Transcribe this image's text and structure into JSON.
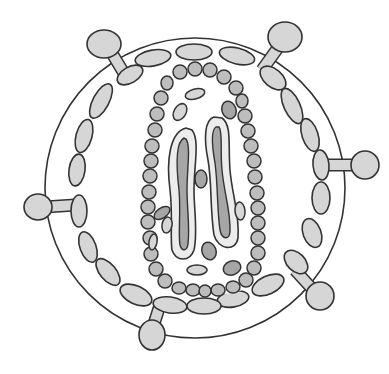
{
  "diagram": {
    "colors": {
      "background": "#ffffff",
      "stroke": "#333333",
      "light_fill": "#d6d6d6",
      "medium_fill": "#bdbdbd",
      "dark_fill": "#a6a6a6",
      "pale_fill": "#ececec"
    },
    "envelope": {
      "cx": 195,
      "cy": 188,
      "r": 150
    },
    "spikes": [
      {
        "name": "spike-top-left",
        "stem": [
          125,
          75,
          110,
          50
        ],
        "knob": [
          104,
          44,
          17,
          14
        ]
      },
      {
        "name": "spike-top-right",
        "stem": [
          262,
          70,
          280,
          45
        ],
        "knob": [
          285,
          37,
          17,
          15
        ]
      },
      {
        "name": "spike-right",
        "stem": [
          328,
          165,
          355,
          165
        ],
        "knob": [
          365,
          165,
          14,
          14
        ]
      },
      {
        "name": "spike-left",
        "stem": [
          75,
          205,
          45,
          207
        ],
        "knob": [
          38,
          207,
          14,
          13
        ]
      },
      {
        "name": "spike-bottom-left",
        "stem": [
          160,
          305,
          152,
          330
        ],
        "knob": [
          152,
          335,
          13,
          15
        ]
      },
      {
        "name": "spike-bottom-right",
        "stem": [
          295,
          270,
          315,
          292
        ],
        "knob": [
          320,
          296,
          14,
          14
        ]
      }
    ],
    "matrix_ellipses": [
      [
        153,
        58,
        18,
        8,
        -10
      ],
      [
        194,
        52,
        18,
        8,
        0
      ],
      [
        237,
        56,
        18,
        8,
        14
      ],
      [
        130,
        75,
        14,
        8,
        -30
      ],
      [
        273,
        78,
        15,
        9,
        40
      ],
      [
        101,
        101,
        19,
        8,
        -62
      ],
      [
        292,
        106,
        19,
        8,
        65
      ],
      [
        84,
        136,
        17,
        8,
        -75
      ],
      [
        310,
        135,
        17,
        8,
        72
      ],
      [
        77,
        170,
        16,
        8,
        -82
      ],
      [
        321,
        165,
        15,
        8,
        85
      ],
      [
        79,
        211,
        16,
        8,
        90
      ],
      [
        321,
        198,
        16,
        9,
        90
      ],
      [
        88,
        247,
        16,
        8,
        70
      ],
      [
        312,
        233,
        15,
        9,
        70
      ],
      [
        108,
        272,
        16,
        8,
        50
      ],
      [
        296,
        262,
        14,
        9,
        45
      ],
      [
        136,
        295,
        17,
        9,
        25
      ],
      [
        268,
        285,
        17,
        9,
        -25
      ],
      [
        170,
        305,
        17,
        8,
        8
      ],
      [
        233,
        299,
        16,
        8,
        -10
      ],
      [
        204,
        306,
        17,
        8,
        0
      ]
    ],
    "capsid_beads": [
      [
        180,
        72,
        7,
        7
      ],
      [
        195,
        69,
        7,
        7
      ],
      [
        210,
        70,
        7,
        7
      ],
      [
        224,
        77,
        7,
        7
      ],
      [
        167,
        83,
        6,
        7
      ],
      [
        236,
        88,
        7,
        7
      ],
      [
        161,
        98,
        7,
        7
      ],
      [
        242,
        101,
        6,
        7
      ],
      [
        157,
        114,
        7,
        7
      ],
      [
        245,
        116,
        7,
        7
      ],
      [
        155,
        130,
        7,
        7
      ],
      [
        248,
        131,
        7,
        7
      ],
      [
        152,
        146,
        7,
        7
      ],
      [
        251,
        146,
        7,
        7
      ],
      [
        151,
        161,
        7,
        7
      ],
      [
        254,
        161,
        7,
        7
      ],
      [
        150,
        176,
        7,
        7
      ],
      [
        255,
        177,
        7,
        7
      ],
      [
        149,
        192,
        7,
        7
      ],
      [
        257,
        193,
        7,
        7
      ],
      [
        148,
        207,
        7,
        7
      ],
      [
        258,
        208,
        7,
        7
      ],
      [
        148,
        222,
        7,
        7
      ],
      [
        258,
        223,
        7,
        7
      ],
      [
        150,
        238,
        7,
        7
      ],
      [
        258,
        238,
        7,
        7
      ],
      [
        151,
        254,
        7,
        7
      ],
      [
        258,
        253,
        7,
        7
      ],
      [
        156,
        269,
        7,
        7
      ],
      [
        254,
        268,
        7,
        7
      ],
      [
        165,
        281,
        7,
        7
      ],
      [
        246,
        280,
        7,
        7
      ],
      [
        179,
        288,
        7,
        6
      ],
      [
        233,
        287,
        7,
        6
      ],
      [
        193,
        290,
        7,
        6
      ],
      [
        218,
        290,
        7,
        6
      ],
      [
        205,
        291,
        6,
        6
      ]
    ],
    "inner_particles": [
      [
        195,
        94,
        10,
        5,
        -15,
        "light"
      ],
      [
        229,
        110,
        7,
        9,
        -20,
        "dark"
      ],
      [
        180,
        112,
        6,
        9,
        30,
        "light"
      ],
      [
        201,
        179,
        6,
        9,
        0,
        "dark"
      ],
      [
        162,
        213,
        9,
        5,
        -35,
        "dark"
      ],
      [
        153,
        242,
        4,
        8,
        10,
        "light"
      ],
      [
        240,
        211,
        5,
        9,
        -5,
        "light"
      ],
      [
        209,
        251,
        7,
        9,
        -20,
        "dark"
      ],
      [
        232,
        268,
        9,
        7,
        -20,
        "dark"
      ],
      [
        197,
        270,
        10,
        5,
        0,
        "light"
      ],
      [
        167,
        225,
        5,
        8,
        10,
        "light"
      ]
    ]
  }
}
